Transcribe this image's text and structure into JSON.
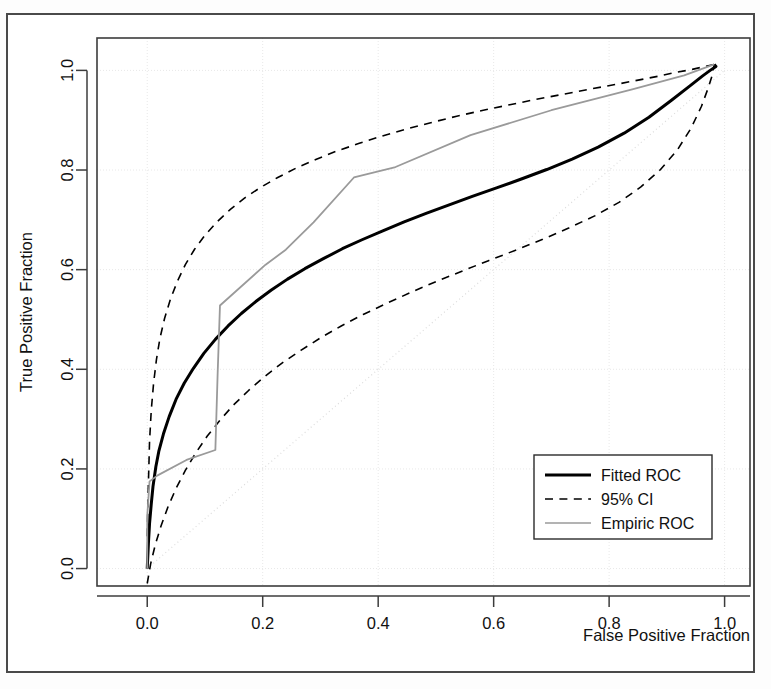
{
  "figure": {
    "background_color": "#ffffff",
    "border_color": "#4a4a4a"
  },
  "chart_data": {
    "type": "line",
    "title": "",
    "xlabel": "False Positive Fraction",
    "ylabel": "True Positive Fraction",
    "xlim": [
      -0.087,
      1.044
    ],
    "ylim": [
      -0.035,
      1.065
    ],
    "xticks": [
      0.0,
      0.2,
      0.4,
      0.6,
      0.8,
      1.0
    ],
    "yticks": [
      0.0,
      0.2,
      0.4,
      0.6,
      0.8,
      1.0
    ],
    "xticklabels": [
      "0.0",
      "0.2",
      "0.4",
      "0.6",
      "0.8",
      "1.0"
    ],
    "yticklabels": [
      "0.0",
      "0.2",
      "0.4",
      "0.6",
      "0.8",
      "1.0"
    ],
    "grid": true,
    "grid_color": "#e8e8e8",
    "legend_position": "lower-right",
    "series": [
      {
        "name": "Fitted ROC",
        "style": "solid",
        "color": "#000000",
        "width": 3.0,
        "points": [
          [
            0.0,
            0.0
          ],
          [
            0.002,
            0.05
          ],
          [
            0.004,
            0.09
          ],
          [
            0.007,
            0.13
          ],
          [
            0.01,
            0.165
          ],
          [
            0.015,
            0.205
          ],
          [
            0.02,
            0.235
          ],
          [
            0.028,
            0.27
          ],
          [
            0.038,
            0.305
          ],
          [
            0.05,
            0.34
          ],
          [
            0.064,
            0.372
          ],
          [
            0.08,
            0.402
          ],
          [
            0.098,
            0.432
          ],
          [
            0.118,
            0.46
          ],
          [
            0.14,
            0.487
          ],
          [
            0.163,
            0.512
          ],
          [
            0.188,
            0.536
          ],
          [
            0.215,
            0.559
          ],
          [
            0.243,
            0.581
          ],
          [
            0.273,
            0.602
          ],
          [
            0.305,
            0.622
          ],
          [
            0.338,
            0.642
          ],
          [
            0.372,
            0.66
          ],
          [
            0.408,
            0.678
          ],
          [
            0.445,
            0.696
          ],
          [
            0.483,
            0.713
          ],
          [
            0.523,
            0.73
          ],
          [
            0.563,
            0.747
          ],
          [
            0.605,
            0.764
          ],
          [
            0.648,
            0.782
          ],
          [
            0.692,
            0.801
          ],
          [
            0.736,
            0.822
          ],
          [
            0.781,
            0.846
          ],
          [
            0.826,
            0.874
          ],
          [
            0.869,
            0.906
          ],
          [
            0.908,
            0.94
          ],
          [
            0.94,
            0.969
          ],
          [
            0.962,
            0.989
          ],
          [
            0.975,
            1.0
          ],
          [
            0.985,
            1.008
          ],
          [
            0.982,
            1.012
          ]
        ]
      },
      {
        "name": "95% CI",
        "style": "dashed",
        "color": "#000000",
        "width": 1.6,
        "curves": [
          {
            "side": "upper",
            "points": [
              [
                0.0,
                0.065
              ],
              [
                0.002,
                0.17
              ],
              [
                0.004,
                0.255
              ],
              [
                0.007,
                0.318
              ],
              [
                0.011,
                0.372
              ],
              [
                0.016,
                0.42
              ],
              [
                0.022,
                0.462
              ],
              [
                0.03,
                0.502
              ],
              [
                0.04,
                0.54
              ],
              [
                0.052,
                0.576
              ],
              [
                0.066,
                0.61
              ],
              [
                0.082,
                0.641
              ],
              [
                0.1,
                0.669
              ],
              [
                0.121,
                0.696
              ],
              [
                0.144,
                0.721
              ],
              [
                0.169,
                0.744
              ],
              [
                0.196,
                0.765
              ],
              [
                0.226,
                0.785
              ],
              [
                0.258,
                0.804
              ],
              [
                0.292,
                0.821
              ],
              [
                0.328,
                0.838
              ],
              [
                0.366,
                0.853
              ],
              [
                0.406,
                0.868
              ],
              [
                0.448,
                0.882
              ],
              [
                0.491,
                0.895
              ],
              [
                0.536,
                0.908
              ],
              [
                0.582,
                0.92
              ],
              [
                0.628,
                0.931
              ],
              [
                0.674,
                0.942
              ],
              [
                0.72,
                0.952
              ],
              [
                0.765,
                0.962
              ],
              [
                0.808,
                0.971
              ],
              [
                0.848,
                0.98
              ],
              [
                0.884,
                0.988
              ],
              [
                0.916,
                0.996
              ],
              [
                0.944,
                1.002
              ],
              [
                0.966,
                1.008
              ],
              [
                0.982,
                1.012
              ]
            ]
          },
          {
            "side": "lower",
            "points": [
              [
                0.0,
                -0.03
              ],
              [
                0.006,
                0.01
              ],
              [
                0.014,
                0.048
              ],
              [
                0.024,
                0.086
              ],
              [
                0.036,
                0.124
              ],
              [
                0.05,
                0.161
              ],
              [
                0.066,
                0.197
              ],
              [
                0.084,
                0.232
              ],
              [
                0.104,
                0.266
              ],
              [
                0.126,
                0.298
              ],
              [
                0.15,
                0.329
              ],
              [
                0.176,
                0.358
              ],
              [
                0.204,
                0.386
              ],
              [
                0.234,
                0.413
              ],
              [
                0.266,
                0.438
              ],
              [
                0.3,
                0.463
              ],
              [
                0.336,
                0.487
              ],
              [
                0.374,
                0.51
              ],
              [
                0.414,
                0.532
              ],
              [
                0.456,
                0.554
              ],
              [
                0.5,
                0.576
              ],
              [
                0.545,
                0.597
              ],
              [
                0.591,
                0.618
              ],
              [
                0.638,
                0.639
              ],
              [
                0.685,
                0.661
              ],
              [
                0.731,
                0.684
              ],
              [
                0.775,
                0.708
              ],
              [
                0.817,
                0.735
              ],
              [
                0.855,
                0.766
              ],
              [
                0.889,
                0.801
              ],
              [
                0.918,
                0.84
              ],
              [
                0.942,
                0.884
              ],
              [
                0.96,
                0.928
              ],
              [
                0.972,
                0.966
              ],
              [
                0.979,
                0.992
              ],
              [
                0.982,
                1.012
              ]
            ]
          }
        ]
      },
      {
        "name": "Empiric ROC",
        "style": "solid",
        "color": "#9a9a9a",
        "width": 1.8,
        "points": [
          [
            0.0,
            0.0
          ],
          [
            0.0,
            0.063
          ],
          [
            0.0,
            0.105
          ],
          [
            0.002,
            0.14
          ],
          [
            0.004,
            0.175
          ],
          [
            0.018,
            0.187
          ],
          [
            0.068,
            0.218
          ],
          [
            0.118,
            0.238
          ],
          [
            0.122,
            0.393
          ],
          [
            0.126,
            0.528
          ],
          [
            0.205,
            0.61
          ],
          [
            0.24,
            0.64
          ],
          [
            0.288,
            0.695
          ],
          [
            0.358,
            0.785
          ],
          [
            0.43,
            0.806
          ],
          [
            0.56,
            0.87
          ],
          [
            0.7,
            0.92
          ],
          [
            0.84,
            0.962
          ],
          [
            0.93,
            0.99
          ],
          [
            0.982,
            1.012
          ]
        ]
      },
      {
        "name": "chance-diagonal",
        "style": "dotted",
        "color": "#dcdcdc",
        "width": 1.2,
        "points": [
          [
            0.0,
            0.0
          ],
          [
            1.0,
            1.0
          ]
        ]
      }
    ]
  },
  "legend": {
    "items": [
      {
        "label": "Fitted ROC",
        "style": "solid",
        "color": "#000000",
        "width": 3.0
      },
      {
        "label": "95% CI",
        "style": "dashed",
        "color": "#000000",
        "width": 1.6
      },
      {
        "label": "Empiric ROC",
        "style": "solid",
        "color": "#9a9a9a",
        "width": 1.4
      }
    ]
  }
}
